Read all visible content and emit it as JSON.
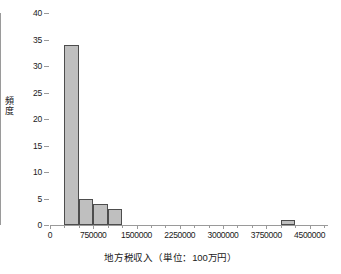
{
  "chart_data": {
    "type": "bar",
    "title": "",
    "xlabel": "地方税収入（単位：100万円）",
    "ylabel": "頻度",
    "ylim": [
      0,
      40
    ],
    "xlim": [
      0,
      4750000
    ],
    "grid": false,
    "legend": null,
    "bin_width": 250000,
    "y_ticks": [
      0,
      5,
      10,
      15,
      20,
      25,
      30,
      35,
      40
    ],
    "y_tick_labels": [
      "0",
      "5",
      "10",
      "15",
      "20",
      "25",
      "30",
      "35",
      "40"
    ],
    "x_ticks": [
      0,
      750000,
      1500000,
      2250000,
      3000000,
      3750000,
      4500000
    ],
    "x_tick_labels": [
      "0",
      "750000",
      "1500000",
      "2250000",
      "3000000",
      "3750000",
      "4500000"
    ],
    "bars": [
      {
        "bin_start": 250000,
        "bin_end": 500000,
        "value": 34
      },
      {
        "bin_start": 500000,
        "bin_end": 750000,
        "value": 5
      },
      {
        "bin_start": 750000,
        "bin_end": 1000000,
        "value": 4
      },
      {
        "bin_start": 1000000,
        "bin_end": 1250000,
        "value": 3
      },
      {
        "bin_start": 4000000,
        "bin_end": 4250000,
        "value": 1
      }
    ],
    "categories": [
      "250000-500000",
      "500000-750000",
      "750000-1000000",
      "1000000-1250000",
      "4000000-4250000"
    ],
    "values": [
      34,
      5,
      4,
      3,
      1
    ],
    "colors": {
      "bar_fill": "#bfbfbf",
      "bar_border": "#4d4d4d",
      "axis": "#9a9a9a",
      "text": "#1a1a1a",
      "background": "#ffffff"
    }
  },
  "axis_titles": {
    "x": "地方税収入（単位：100万円）",
    "y": "頻度"
  }
}
